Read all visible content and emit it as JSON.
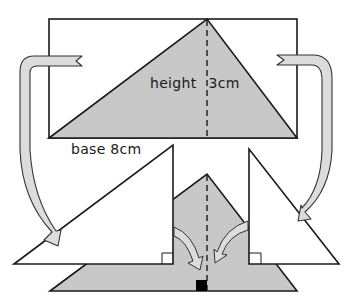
{
  "figure": {
    "caption_fragment": "...ompleted the parallelogram ...",
    "labels": {
      "height": "height",
      "height_value": "3cm",
      "base": "base 8cm"
    },
    "measurements": {
      "base_cm": 8,
      "height_cm": 3
    },
    "colors": {
      "shade": "#c8c8c8",
      "arrow_fill": "#dcdcdc",
      "stroke": "#1a1a1a",
      "marker": "#000000"
    },
    "shapes": {
      "rectangle": "outer rectangle enclosing the triangle",
      "top_triangle": "shaded triangle inscribed in rectangle, with dashed height line",
      "left_piece": "white right triangle cut from the left of the rectangle",
      "right_piece": "white right triangle cut from the right of the rectangle",
      "bottom_triangle": "shaded triangle rearranged below, with dashed height line"
    },
    "arrows": [
      "left curved arrow moving the left corner piece down",
      "right curved arrow moving the right corner piece down",
      "small inner arrow from left piece toward center",
      "small inner arrow from right piece toward center"
    ]
  }
}
